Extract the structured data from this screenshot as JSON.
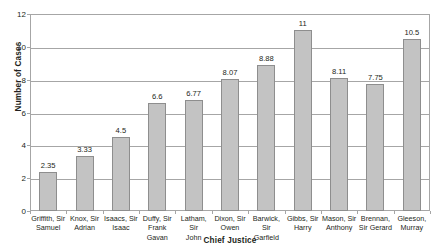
{
  "chart_data": {
    "type": "bar",
    "title": "",
    "xlabel": "Chief Justice",
    "ylabel": "Number of Cases",
    "ylim": [
      0,
      12
    ],
    "yticks": [
      0,
      2,
      4,
      6,
      8,
      10,
      12
    ],
    "grid": true,
    "legend": "none",
    "bar_color": "#c3c3c3",
    "bar_border_color": "#8e8e8e",
    "axis_color": "#a6a6a6",
    "categories": [
      "Griffith, Sir Samuel",
      "Knox, Sir Adrian",
      "Isaacs, Sir Isaac",
      "Duffy, Sir Frank Gavan",
      "Latham, Sir John",
      "Dixon, Sir Owen",
      "Barwick, Sir Garfield",
      "Gibbs, Sir Harry",
      "Mason, Sir Anthony",
      "Brennan, Sir Gerard",
      "Gleeson, Murray"
    ],
    "category_lines": [
      [
        "Griffith, Sir",
        "Samuel"
      ],
      [
        "Knox, Sir",
        "Adrian"
      ],
      [
        "Isaacs, Sir",
        "Isaac"
      ],
      [
        "Duffy, Sir",
        "Frank Gavan"
      ],
      [
        "Latham, Sir",
        "John"
      ],
      [
        "Dixon, Sir",
        "Owen"
      ],
      [
        "Barwick, Sir",
        "Garfield"
      ],
      [
        "Gibbs, Sir",
        "Harry"
      ],
      [
        "Mason, Sir",
        "Anthony"
      ],
      [
        "Brennan,",
        "Sir Gerard"
      ],
      [
        "Gleeson,",
        "Murray"
      ]
    ],
    "values": [
      2.35,
      3.33,
      4.5,
      6.6,
      6.77,
      8.07,
      8.88,
      11,
      8.11,
      7.75,
      10.5
    ],
    "value_labels": [
      "2.35",
      "3.33",
      "4.5",
      "6.6",
      "6.77",
      "8.07",
      "8.88",
      "11",
      "8.11",
      "7.75",
      "10.5"
    ],
    "ytick_labels": [
      "0",
      "2",
      "4",
      "6",
      "8",
      "10",
      "12"
    ]
  }
}
